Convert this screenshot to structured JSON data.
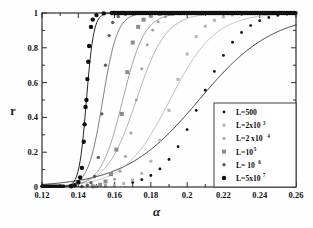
{
  "chart_data": {
    "type": "line",
    "title": "",
    "xlabel": "α",
    "ylabel": "r",
    "xlim": [
      0.12,
      0.26
    ],
    "ylim": [
      0.0,
      1.0
    ],
    "xticks": [
      0.12,
      0.14,
      0.16,
      0.18,
      0.2,
      0.22,
      0.24,
      0.26
    ],
    "xticklabels": [
      "0.12",
      "0.14",
      "0.16",
      "0.18",
      "0.2",
      "0.22",
      "0.24",
      "0.26"
    ],
    "yticks": [
      0,
      0.2,
      0.4,
      0.6,
      0.8,
      1
    ],
    "yticklabels": [
      "0",
      "0.2",
      "0.4",
      "0.6",
      "0.8",
      "1"
    ],
    "grid": false,
    "legend_position": "lower-right",
    "series": [
      {
        "name": "L=500",
        "label_main": "L=500",
        "label_sup": "",
        "color": "#111111",
        "marker": "circle",
        "marker_size": 1.4,
        "line_width": 0.8,
        "midpoint": 0.2065,
        "width": 0.0205,
        "x": [
          0.15,
          0.16,
          0.17,
          0.175,
          0.18,
          0.185,
          0.19,
          0.195,
          0.2,
          0.205,
          0.21,
          0.215,
          0.22,
          0.225,
          0.23,
          0.235,
          0.24,
          0.245,
          0.25,
          0.255,
          0.26
        ],
        "y": [
          0.004,
          0.01,
          0.026,
          0.042,
          0.066,
          0.104,
          0.158,
          0.232,
          0.33,
          0.44,
          0.556,
          0.664,
          0.756,
          0.832,
          0.888,
          0.928,
          0.956,
          0.974,
          0.986,
          0.993,
          0.997
        ]
      },
      {
        "name": "L=2x10^3",
        "label_main": "L=2x10",
        "label_sup": "3",
        "color": "#b4b4b4",
        "marker": "square",
        "marker_size": 1.5,
        "line_width": 0.8,
        "midpoint": 0.1905,
        "width": 0.0125,
        "x": [
          0.15,
          0.155,
          0.16,
          0.165,
          0.17,
          0.175,
          0.18,
          0.185,
          0.19,
          0.195,
          0.2,
          0.205,
          0.21,
          0.215,
          0.22,
          0.225,
          0.23
        ],
        "y": [
          0.002,
          0.005,
          0.01,
          0.02,
          0.04,
          0.078,
          0.148,
          0.268,
          0.44,
          0.618,
          0.764,
          0.864,
          0.924,
          0.958,
          0.978,
          0.989,
          0.995
        ]
      },
      {
        "name": "L=2 x10^4",
        "label_main": "L=2 x10",
        "label_sup": "4",
        "color": "#a0a0a0",
        "marker": "circle",
        "marker_size": 1.5,
        "line_width": 0.8,
        "midpoint": 0.172,
        "width": 0.0082,
        "x": [
          0.15,
          0.155,
          0.16,
          0.163,
          0.166,
          0.169,
          0.172,
          0.175,
          0.178,
          0.181,
          0.184,
          0.188,
          0.192,
          0.196,
          0.2,
          0.206
        ],
        "y": [
          0.004,
          0.012,
          0.044,
          0.09,
          0.175,
          0.31,
          0.5,
          0.68,
          0.818,
          0.903,
          0.95,
          0.978,
          0.99,
          0.995,
          0.998,
          0.999
        ]
      },
      {
        "name": "L=10^5",
        "label_main": "L=10",
        "label_sup": "5",
        "color": "#8c8c8c",
        "marker": "square",
        "marker_size": 2.0,
        "line_width": 0.8,
        "midpoint": 0.1645,
        "width": 0.006,
        "x": [
          0.148,
          0.152,
          0.155,
          0.158,
          0.161,
          0.164,
          0.167,
          0.17,
          0.173,
          0.176,
          0.18,
          0.185,
          0.19
        ],
        "y": [
          0.004,
          0.013,
          0.032,
          0.074,
          0.215,
          0.42,
          0.66,
          0.83,
          0.92,
          0.962,
          0.985,
          0.995,
          0.999
        ]
      },
      {
        "name": "L= 10^6",
        "label_main": "L= 10",
        "label_sup": "6",
        "color": "#5e5e5e",
        "marker": "circle",
        "marker_size": 1.7,
        "line_width": 0.8,
        "midpoint": 0.1535,
        "width": 0.004,
        "x": [
          0.142,
          0.145,
          0.147,
          0.149,
          0.151,
          0.153,
          0.155,
          0.157,
          0.159,
          0.162,
          0.166,
          0.172,
          0.18
        ],
        "y": [
          0.003,
          0.01,
          0.025,
          0.06,
          0.17,
          0.42,
          0.7,
          0.87,
          0.945,
          0.98,
          0.993,
          0.998,
          1.0
        ]
      },
      {
        "name": "L=5x10^7",
        "label_main": "L=5x10",
        "label_sup": "7",
        "color": "#0d0d0d",
        "marker": "circle",
        "marker_size": 2.2,
        "line_width": 0.9,
        "midpoint": 0.1445,
        "width": 0.002,
        "x": [
          0.136,
          0.138,
          0.14,
          0.141,
          0.142,
          0.143,
          0.1435,
          0.144,
          0.1445,
          0.145,
          0.1455,
          0.146,
          0.147,
          0.148,
          0.15,
          0.154,
          0.16
        ],
        "y": [
          0.004,
          0.01,
          0.028,
          0.055,
          0.11,
          0.26,
          0.36,
          0.46,
          0.5,
          0.62,
          0.72,
          0.81,
          0.92,
          0.962,
          0.988,
          0.998,
          1.0
        ]
      }
    ]
  },
  "legend": {
    "entries": [
      {
        "label": "L=500"
      },
      {
        "label": "L=2x10³"
      },
      {
        "label": "L=2 x10⁴"
      },
      {
        "label": "L=10⁵"
      },
      {
        "label": "L= 10⁶"
      },
      {
        "label": "L=5x10⁷"
      }
    ]
  },
  "axes": {
    "xlabel": "α",
    "ylabel": "r"
  }
}
